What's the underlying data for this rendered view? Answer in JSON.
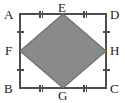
{
  "figure": {
    "type": "geometry-diagram",
    "colors": {
      "stroke": "#4d4d4d",
      "shaded_fill": "#8a8a8a",
      "shaded_stroke": "#6f6f6f",
      "label_color": "#1a1a1a",
      "tick_color": "#4d4d4d",
      "background": "#ffffff"
    },
    "rectangle": {
      "x": 20,
      "y": 14,
      "width": 86,
      "height": 74
    },
    "labels": [
      {
        "id": "A",
        "text": "A",
        "role": "rectangle-corner-top-left",
        "x": 4,
        "y": 8
      },
      {
        "id": "D",
        "text": "D",
        "role": "rectangle-corner-top-right",
        "x": 110,
        "y": 8
      },
      {
        "id": "B",
        "text": "B",
        "role": "rectangle-corner-bottom-left",
        "x": 4,
        "y": 82
      },
      {
        "id": "C",
        "text": "C",
        "role": "rectangle-corner-bottom-right",
        "x": 110,
        "y": 82
      },
      {
        "id": "E",
        "text": "E",
        "role": "midpoint-top",
        "x": 58,
        "y": 1
      },
      {
        "id": "G",
        "text": "G",
        "role": "midpoint-bottom",
        "x": 58,
        "y": 89
      },
      {
        "id": "F",
        "text": "F",
        "role": "midpoint-left",
        "x": 5,
        "y": 44
      },
      {
        "id": "H",
        "text": "H",
        "role": "midpoint-right",
        "x": 110,
        "y": 44
      }
    ],
    "midpoints": [
      {
        "id": "E",
        "x": 63,
        "y": 14
      },
      {
        "id": "H",
        "x": 106,
        "y": 51
      },
      {
        "id": "G",
        "x": 63,
        "y": 88
      },
      {
        "id": "F",
        "x": 20,
        "y": 51
      }
    ],
    "rhombus_points": "63,14 106,51 63,88 20,51",
    "tick_marks": [
      {
        "segment": "AE",
        "count": 2,
        "orientation": "vertical",
        "cx": 41,
        "cy": 14
      },
      {
        "segment": "ED",
        "count": 2,
        "orientation": "vertical",
        "cx": 85,
        "cy": 14
      },
      {
        "segment": "BG",
        "count": 2,
        "orientation": "vertical",
        "cx": 41,
        "cy": 88
      },
      {
        "segment": "GC",
        "count": 2,
        "orientation": "vertical",
        "cx": 85,
        "cy": 88
      },
      {
        "segment": "AF",
        "count": 1,
        "orientation": "horizontal",
        "cx": 20,
        "cy": 32
      },
      {
        "segment": "FB",
        "count": 1,
        "orientation": "horizontal",
        "cx": 20,
        "cy": 70
      },
      {
        "segment": "DH",
        "count": 1,
        "orientation": "horizontal",
        "cx": 106,
        "cy": 32
      },
      {
        "segment": "HC",
        "count": 1,
        "orientation": "horizontal",
        "cx": 106,
        "cy": 70
      }
    ]
  }
}
